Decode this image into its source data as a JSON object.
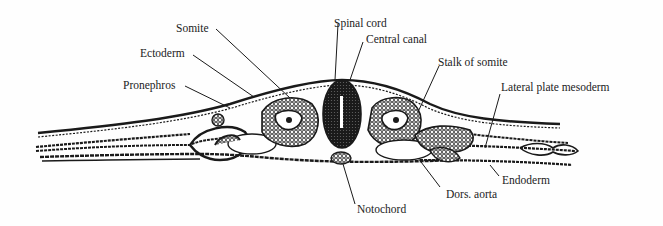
{
  "figure": {
    "type": "anatomical cross-section",
    "labels": {
      "somite": "Somite",
      "ectoderm": "Ectoderm",
      "pronephros": "Pronephros",
      "spinal_cord": "Spinal cord",
      "central_canal": "Central canal",
      "stalk_of_somite": "Stalk of somite",
      "lateral_plate_mesoderm": "Lateral plate mesoderm",
      "endoderm": "Endoderm",
      "dors_aorta": "Dors. aorta",
      "notochord": "Notochord"
    }
  },
  "colors": {
    "ink": "#1a1a1a",
    "paper": "#fefefe"
  }
}
